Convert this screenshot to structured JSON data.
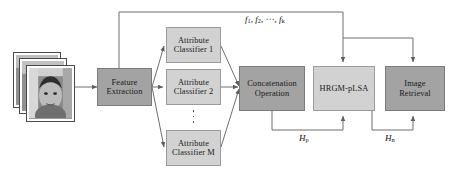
{
  "diagram": {
    "background_color": "#ffffff",
    "node_fill_dark": "#a3a3a3",
    "node_fill_light": "#d2d2d2",
    "line_color": "#6f6f6f"
  },
  "nodes": {
    "feature_extraction": {
      "label": "Feature\nExtraction",
      "shade": "dark"
    },
    "attribute_classifier_1": {
      "label": "Attribute\nClassifier 1",
      "shade": "light"
    },
    "attribute_classifier_2": {
      "label": "Attribute\nClassifier 2",
      "shade": "light"
    },
    "attribute_classifier_m": {
      "label": "Attribute\nClassifier M",
      "shade": "light"
    },
    "concatenation_operation": {
      "label": "Concatenation\nOperation",
      "shade": "dark"
    },
    "hrgm_plsa": {
      "label": "HRGM-pLSA",
      "shade": "light"
    },
    "image_retrieval": {
      "label": "Image\nRetrieval",
      "shade": "dark"
    }
  },
  "image_stack": {
    "name": "face-image-stack",
    "count": 3,
    "description": "grayscale face photographs"
  },
  "labels": {
    "features": {
      "f1": "f",
      "f1sub": "1",
      "f2": "f",
      "f2sub": "2",
      "dots": "⋯",
      "fk": "f",
      "fksub": "k",
      "sep": ", "
    },
    "hp": {
      "base": "H",
      "sub": "p"
    },
    "hn": {
      "base": "H",
      "sub": "n"
    },
    "vertical_ellipsis": "⋮"
  }
}
